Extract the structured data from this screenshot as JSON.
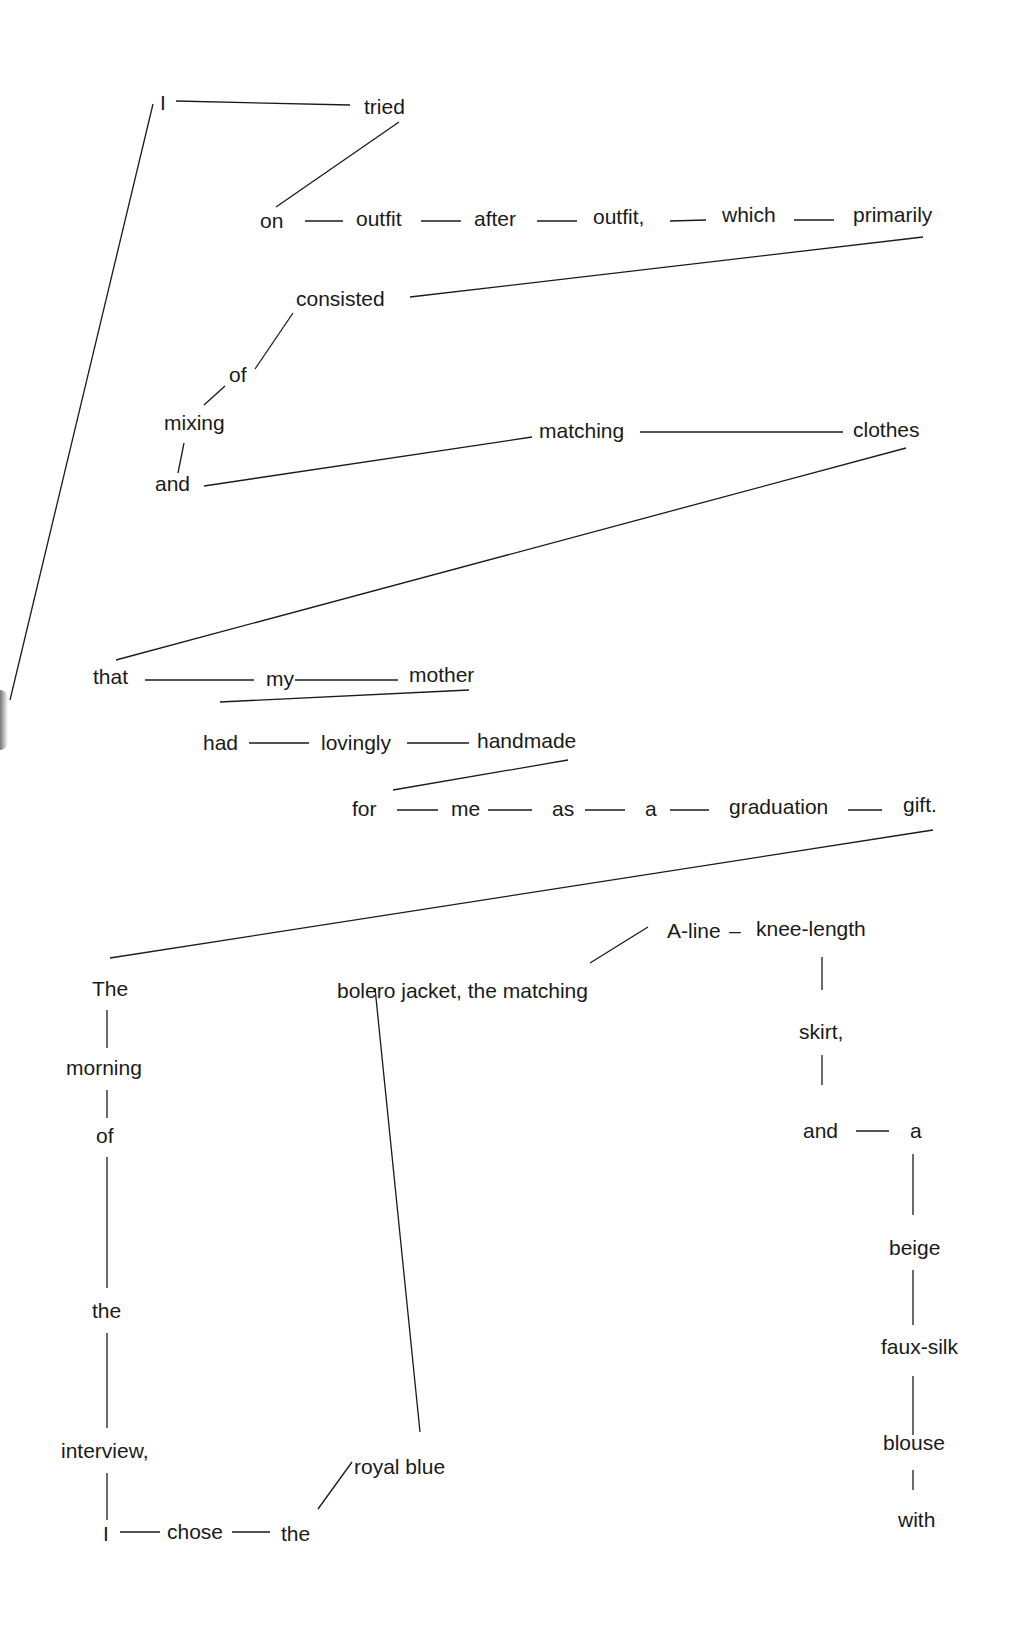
{
  "diagram": {
    "type": "sentence-diagram",
    "words": [
      {
        "id": "w_I1",
        "text": "I",
        "x": 160,
        "y": 110
      },
      {
        "id": "w_tried",
        "text": "tried",
        "x": 364,
        "y": 114
      },
      {
        "id": "w_on",
        "text": "on",
        "x": 260,
        "y": 228
      },
      {
        "id": "w_outfit1",
        "text": "outfit",
        "x": 356,
        "y": 226
      },
      {
        "id": "w_after",
        "text": "after",
        "x": 474,
        "y": 226
      },
      {
        "id": "w_outfit2",
        "text": "outfit,",
        "x": 593,
        "y": 224
      },
      {
        "id": "w_which",
        "text": "which",
        "x": 722,
        "y": 222
      },
      {
        "id": "w_primarily",
        "text": "primarily",
        "x": 853,
        "y": 222
      },
      {
        "id": "w_consisted",
        "text": "consisted",
        "x": 296,
        "y": 306
      },
      {
        "id": "w_of1",
        "text": "of",
        "x": 229,
        "y": 382
      },
      {
        "id": "w_mixing",
        "text": "mixing",
        "x": 164,
        "y": 430
      },
      {
        "id": "w_and1",
        "text": "and",
        "x": 155,
        "y": 491
      },
      {
        "id": "w_matching1",
        "text": "matching",
        "x": 539,
        "y": 438
      },
      {
        "id": "w_clothes",
        "text": "clothes",
        "x": 853,
        "y": 437
      },
      {
        "id": "w_that",
        "text": "that",
        "x": 93,
        "y": 684
      },
      {
        "id": "w_my",
        "text": "my",
        "x": 266,
        "y": 686
      },
      {
        "id": "w_mother",
        "text": "mother",
        "x": 409,
        "y": 682
      },
      {
        "id": "w_had",
        "text": "had",
        "x": 203,
        "y": 750
      },
      {
        "id": "w_lovingly",
        "text": "lovingly",
        "x": 321,
        "y": 750
      },
      {
        "id": "w_handmade",
        "text": "handmade",
        "x": 477,
        "y": 748
      },
      {
        "id": "w_for",
        "text": "for",
        "x": 352,
        "y": 816
      },
      {
        "id": "w_me",
        "text": "me",
        "x": 451,
        "y": 816
      },
      {
        "id": "w_as",
        "text": "as",
        "x": 552,
        "y": 816
      },
      {
        "id": "w_a1",
        "text": "a",
        "x": 645,
        "y": 816
      },
      {
        "id": "w_graduation",
        "text": "graduation",
        "x": 729,
        "y": 814
      },
      {
        "id": "w_gift",
        "text": "gift.",
        "x": 903,
        "y": 812
      },
      {
        "id": "w_The",
        "text": "The",
        "x": 92,
        "y": 996
      },
      {
        "id": "w_bolero",
        "text": "bolero jacket, the matching",
        "x": 337,
        "y": 998
      },
      {
        "id": "w_Aline",
        "text": "A-line",
        "x": 667,
        "y": 938
      },
      {
        "id": "w_dash",
        "text": "–",
        "x": 729,
        "y": 938
      },
      {
        "id": "w_kneelength",
        "text": "knee-length",
        "x": 756,
        "y": 936
      },
      {
        "id": "w_skirt",
        "text": "skirt,",
        "x": 799,
        "y": 1039
      },
      {
        "id": "w_morning",
        "text": "morning",
        "x": 66,
        "y": 1075
      },
      {
        "id": "w_of2",
        "text": "of",
        "x": 96,
        "y": 1143
      },
      {
        "id": "w_and2",
        "text": "and",
        "x": 803,
        "y": 1138
      },
      {
        "id": "w_a2",
        "text": "a",
        "x": 910,
        "y": 1138
      },
      {
        "id": "w_beige",
        "text": "beige",
        "x": 889,
        "y": 1255
      },
      {
        "id": "w_the1",
        "text": "the",
        "x": 92,
        "y": 1318
      },
      {
        "id": "w_fauxsilk",
        "text": "faux-silk",
        "x": 881,
        "y": 1354
      },
      {
        "id": "w_interview",
        "text": "interview,",
        "x": 61,
        "y": 1458
      },
      {
        "id": "w_blouse",
        "text": "blouse",
        "x": 883,
        "y": 1450
      },
      {
        "id": "w_royalblue",
        "text": "royal blue",
        "x": 354,
        "y": 1474
      },
      {
        "id": "w_I2",
        "text": "I",
        "x": 103,
        "y": 1541
      },
      {
        "id": "w_chose",
        "text": "chose",
        "x": 167,
        "y": 1539
      },
      {
        "id": "w_the2",
        "text": "the",
        "x": 281,
        "y": 1541
      },
      {
        "id": "w_with",
        "text": "with",
        "x": 898,
        "y": 1527
      }
    ],
    "lines": [
      [
        176,
        101,
        350,
        105
      ],
      [
        399,
        122,
        276,
        207
      ],
      [
        153,
        104,
        10,
        700
      ],
      [
        305,
        221,
        343,
        221
      ],
      [
        421,
        221,
        461,
        221
      ],
      [
        537,
        221,
        577,
        221
      ],
      [
        670,
        221,
        706,
        220
      ],
      [
        794,
        220,
        834,
        220
      ],
      [
        923,
        237,
        410,
        297
      ],
      [
        293,
        313,
        255,
        369
      ],
      [
        225,
        386,
        204,
        405
      ],
      [
        184,
        443,
        178,
        473
      ],
      [
        204,
        486,
        532,
        437
      ],
      [
        640,
        432,
        843,
        432
      ],
      [
        906,
        448,
        116,
        660
      ],
      [
        145,
        680,
        254,
        680
      ],
      [
        295,
        680,
        398,
        680
      ],
      [
        469,
        690,
        220,
        702
      ],
      [
        249,
        743,
        309,
        743
      ],
      [
        407,
        743,
        469,
        743
      ],
      [
        568,
        760,
        393,
        790
      ],
      [
        397,
        810,
        438,
        810
      ],
      [
        488,
        810,
        532,
        810
      ],
      [
        585,
        810,
        625,
        810
      ],
      [
        670,
        810,
        709,
        810
      ],
      [
        848,
        810,
        882,
        810
      ],
      [
        933,
        830,
        110,
        958
      ],
      [
        648,
        927,
        590,
        963
      ],
      [
        822,
        957,
        822,
        990
      ],
      [
        822,
        1055,
        822,
        1085
      ],
      [
        856,
        1131,
        889,
        1131
      ],
      [
        913,
        1154,
        913,
        1215
      ],
      [
        913,
        1270,
        913,
        1325
      ],
      [
        913,
        1376,
        913,
        1435
      ],
      [
        913,
        1470,
        913,
        1490
      ],
      [
        107,
        1010,
        107,
        1048
      ],
      [
        107,
        1090,
        107,
        1118
      ],
      [
        107,
        1157,
        107,
        1288
      ],
      [
        107,
        1333,
        107,
        1428
      ],
      [
        107,
        1473,
        107,
        1520
      ],
      [
        120,
        1532,
        160,
        1532
      ],
      [
        232,
        1532,
        270,
        1532
      ],
      [
        375,
        988,
        420,
        1432
      ],
      [
        352,
        1462,
        318,
        1509
      ]
    ]
  }
}
